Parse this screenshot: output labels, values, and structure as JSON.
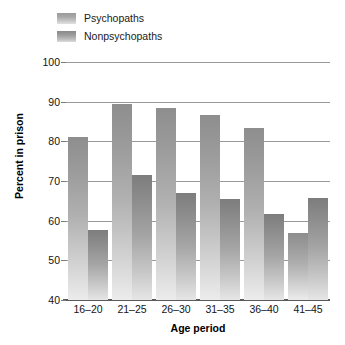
{
  "chart_data": {
    "type": "bar",
    "title": "",
    "xlabel": "Age period",
    "ylabel": "Percent in prison",
    "categories": [
      "16–20",
      "21–25",
      "26–30",
      "31–35",
      "36–40",
      "41–45"
    ],
    "ylim": [
      40,
      100
    ],
    "yticks": [
      40,
      50,
      60,
      70,
      80,
      90,
      100
    ],
    "ytick_labels": [
      "40",
      "50",
      "60",
      "70",
      "80",
      "90",
      "100"
    ],
    "grid": true,
    "legend_position": "top-left",
    "series": [
      {
        "name": "Psychopaths",
        "color": "#9a9a9a",
        "values": [
          81,
          89.5,
          88.3,
          86.7,
          83.4,
          57
        ]
      },
      {
        "name": "Nonpsychopaths",
        "color": "#8a8a8a",
        "values": [
          57.6,
          71.5,
          67,
          65.5,
          61.6,
          65.8
        ]
      }
    ]
  },
  "legend": {
    "items": [
      {
        "label": "Psychopaths",
        "swatch": "psych-swatch"
      },
      {
        "label": "Nonpsychopaths",
        "swatch": "nonpsych-swatch"
      }
    ]
  },
  "axes": {
    "y_title": "Percent in prison",
    "x_title": "Age period"
  }
}
